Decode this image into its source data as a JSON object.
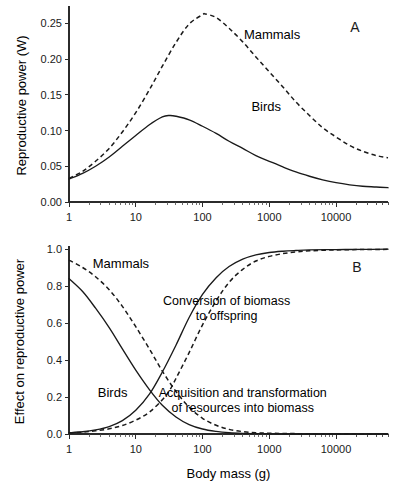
{
  "figure": {
    "panel_a_label": "A",
    "panel_b_label": "B",
    "xlabel": "Body mass (g)"
  },
  "chart_data": [
    {
      "type": "line",
      "panel": "A",
      "title": "",
      "xlabel": "Body mass (g)",
      "ylabel": "Reproductive power (W)",
      "xscale": "log",
      "xlim": [
        1,
        60000
      ],
      "ylim": [
        0.0,
        0.27
      ],
      "xticklabels": [
        "1",
        "10",
        "100",
        "1000",
        "10000"
      ],
      "xtickvalues": [
        1,
        10,
        100,
        1000,
        10000
      ],
      "yticklabels": [
        "0.00",
        "0.05",
        "0.10",
        "0.15",
        "0.20",
        "0.25"
      ],
      "ytickvalues": [
        0.0,
        0.05,
        0.1,
        0.15,
        0.2,
        0.25
      ],
      "grid": false,
      "legend_position": "inline-annotations",
      "series": [
        {
          "name": "Birds",
          "style": "solid",
          "label_x": 900,
          "label_y": 0.128,
          "x": [
            1,
            1.6,
            2.5,
            4,
            6.3,
            10,
            16,
            25,
            32,
            40,
            63,
            100,
            160,
            250,
            400,
            630,
            1000,
            1600,
            2500,
            4000,
            6300,
            10000,
            16000,
            25000,
            40000,
            60000
          ],
          "y": [
            0.032,
            0.04,
            0.05,
            0.063,
            0.078,
            0.093,
            0.108,
            0.119,
            0.121,
            0.12,
            0.115,
            0.106,
            0.096,
            0.085,
            0.075,
            0.065,
            0.057,
            0.049,
            0.042,
            0.036,
            0.031,
            0.027,
            0.024,
            0.022,
            0.021,
            0.02
          ]
        },
        {
          "name": "Mammals",
          "style": "dashed",
          "label_x": 1100,
          "label_y": 0.228,
          "x": [
            1,
            1.6,
            2.5,
            4,
            6.3,
            10,
            16,
            25,
            40,
            63,
            100,
            110,
            160,
            250,
            400,
            630,
            1000,
            1600,
            2500,
            4000,
            6300,
            10000,
            16000,
            25000,
            40000,
            60000
          ],
          "y": [
            0.033,
            0.043,
            0.057,
            0.075,
            0.098,
            0.125,
            0.157,
            0.19,
            0.223,
            0.249,
            0.262,
            0.263,
            0.258,
            0.243,
            0.224,
            0.203,
            0.182,
            0.161,
            0.14,
            0.121,
            0.104,
            0.091,
            0.079,
            0.071,
            0.065,
            0.062
          ]
        }
      ]
    },
    {
      "type": "line",
      "panel": "B",
      "title": "",
      "xlabel": "Body mass (g)",
      "ylabel": "Effect on reproductive power",
      "xscale": "log",
      "xlim": [
        1,
        60000
      ],
      "ylim": [
        0.0,
        1.0
      ],
      "xticklabels": [
        "1",
        "10",
        "100",
        "1000",
        "10000"
      ],
      "xtickvalues": [
        1,
        10,
        100,
        1000,
        10000
      ],
      "yticklabels": [
        "0.0",
        "0.2",
        "0.4",
        "0.6",
        "0.8",
        "1.0"
      ],
      "ytickvalues": [
        0.0,
        0.2,
        0.4,
        0.6,
        0.8,
        1.0
      ],
      "grid": false,
      "legend_position": "inline-annotations",
      "annotations": [
        {
          "text_line1": "Conversion of biomass",
          "text_line2": "to offspring",
          "x": 230,
          "y": 0.7
        },
        {
          "text_line1": "Acquisition and transformation",
          "text_line2": "of resources into biomass",
          "x": 400,
          "y": 0.2
        },
        {
          "text": "Mammals",
          "x": 6,
          "y": 0.9
        },
        {
          "text": "Birds",
          "x": 4.5,
          "y": 0.2
        }
      ],
      "series": [
        {
          "name": "Mammals acquisition",
          "style": "dashed",
          "x": [
            1,
            1.6,
            2.5,
            4,
            6.3,
            10,
            16,
            25,
            40,
            63,
            100,
            160,
            250,
            400,
            630,
            1000,
            2500,
            10000,
            60000
          ],
          "y": [
            0.94,
            0.9,
            0.85,
            0.78,
            0.69,
            0.58,
            0.46,
            0.34,
            0.23,
            0.145,
            0.085,
            0.047,
            0.025,
            0.013,
            0.007,
            0.004,
            0.002,
            0.001,
            0.0
          ]
        },
        {
          "name": "Birds acquisition",
          "style": "solid",
          "x": [
            1,
            1.6,
            2.5,
            4,
            6.3,
            10,
            16,
            25,
            40,
            63,
            100,
            160,
            250,
            400,
            630,
            1000,
            2500,
            10000,
            60000
          ],
          "y": [
            0.84,
            0.77,
            0.68,
            0.575,
            0.46,
            0.345,
            0.24,
            0.155,
            0.092,
            0.051,
            0.027,
            0.014,
            0.007,
            0.0035,
            0.002,
            0.001,
            0.0,
            0.0,
            0.0
          ]
        },
        {
          "name": "Birds conversion",
          "style": "solid",
          "x": [
            1,
            1.6,
            2.5,
            4,
            6.3,
            10,
            16,
            25,
            40,
            63,
            100,
            160,
            250,
            400,
            630,
            1000,
            1600,
            2500,
            4000,
            10000,
            25000,
            60000
          ],
          "y": [
            0.007,
            0.012,
            0.022,
            0.04,
            0.072,
            0.128,
            0.215,
            0.335,
            0.48,
            0.63,
            0.755,
            0.845,
            0.905,
            0.945,
            0.968,
            0.981,
            0.988,
            0.992,
            0.995,
            0.997,
            0.998,
            0.999
          ]
        },
        {
          "name": "Mammals conversion",
          "style": "dashed",
          "x": [
            1,
            1.6,
            2.5,
            4,
            6.3,
            10,
            16,
            25,
            32,
            40,
            63,
            100,
            160,
            250,
            400,
            630,
            1000,
            1600,
            2500,
            4000,
            10000,
            25000,
            60000
          ],
          "y": [
            0.006,
            0.01,
            0.017,
            0.028,
            0.046,
            0.075,
            0.118,
            0.185,
            0.235,
            0.3,
            0.44,
            0.59,
            0.72,
            0.82,
            0.89,
            0.935,
            0.96,
            0.975,
            0.984,
            0.99,
            0.995,
            0.997,
            0.998
          ]
        }
      ]
    }
  ]
}
